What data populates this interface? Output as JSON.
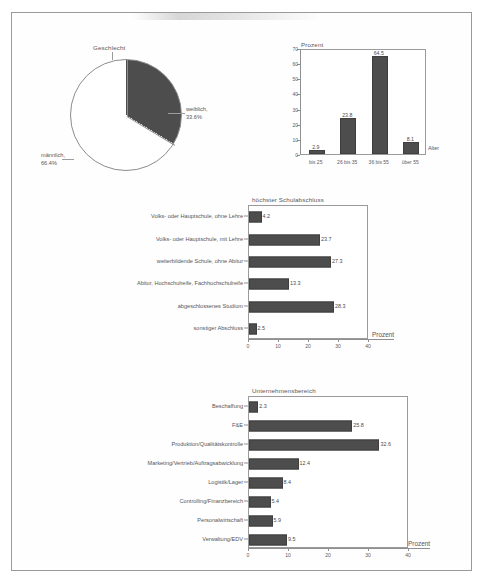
{
  "page": {
    "background_color": "#ffffff",
    "frame_color": "#9a9a9a",
    "bar_color": "#4d4d4d",
    "text_color": "#55565a"
  },
  "charts": {
    "gender": {
      "title": "Geschlecht",
      "labels": {
        "female_name": "weiblich,",
        "female_pct": "33.6%",
        "male_name": "männlich,",
        "male_pct": "66.4%"
      }
    },
    "age": {
      "title": "Prozent",
      "xlabel": "Alter",
      "yticks": [
        "0",
        "10",
        "20",
        "30",
        "40",
        "50",
        "60",
        "70"
      ],
      "categories": [
        "bis 25",
        "26 bis 35",
        "36 bis 55",
        "über 55"
      ],
      "values": [
        "2.9",
        "23.8",
        "64.5",
        "8.1"
      ]
    },
    "education": {
      "title": "höchster Schulabschluss",
      "xlabel": "Prozent",
      "xticks": [
        "0",
        "10",
        "20",
        "30",
        "40"
      ],
      "categories": [
        "Volks- oder Hauptschule, ohne Lehre",
        "Volks- oder Hauptschule, mit Lehre",
        "weiterbildende Schule, ohne Abitur",
        "Abitur, Hochschulreife, Fachhochschulreife",
        "abgeschlossenes Studium",
        "sonstiger Abschluss"
      ],
      "values": [
        "4.2",
        "23.7",
        "27.3",
        "13.3",
        "28.3",
        "2.5"
      ]
    },
    "department": {
      "title": "Unternehmensbereich",
      "xlabel": "Prozent",
      "xticks": [
        "0",
        "10",
        "20",
        "30",
        "40"
      ],
      "categories": [
        "Beschaffung",
        "F&E",
        "Produktion/Qualitätskontrolle",
        "Marketing/Vertrieb/Auftragsabwicklung",
        "Logistik/Lager",
        "Controlling/Finanzbereich",
        "Personalwirtschaft",
        "Verwaltung/EDV"
      ],
      "values": [
        "2.3",
        "25.8",
        "32.6",
        "12.4",
        "8.4",
        "5.4",
        "5.9",
        "9.5"
      ]
    }
  },
  "chart_data": [
    {
      "type": "pie",
      "title": "Geschlecht",
      "categories": [
        "weiblich",
        "männlich"
      ],
      "values": [
        33.6,
        66.4
      ],
      "unit": "%",
      "colors": [
        "#4d4d4d",
        "#ffffff"
      ],
      "legend": "labels-with-leader-lines"
    },
    {
      "type": "bar",
      "orientation": "vertical",
      "title": "Prozent",
      "xlabel": "Alter",
      "ylabel": "Prozent",
      "categories": [
        "bis 25",
        "26 bis 35",
        "36 bis 55",
        "über 55"
      ],
      "values": [
        2.9,
        23.8,
        64.5,
        8.1
      ],
      "ylim": [
        0,
        70
      ],
      "ytick_step": 10,
      "grid": false,
      "data_labels": true
    },
    {
      "type": "bar",
      "orientation": "horizontal",
      "title": "höchster Schulabschluss",
      "xlabel": "Prozent",
      "categories": [
        "Volks- oder Hauptschule, ohne Lehre",
        "Volks- oder Hauptschule, mit Lehre",
        "weiterbildende Schule, ohne Abitur",
        "Abitur, Hochschulreife, Fachhochschulreife",
        "abgeschlossenes Studium",
        "sonstiger Abschluss"
      ],
      "values": [
        4.2,
        23.7,
        27.3,
        13.3,
        28.3,
        2.5
      ],
      "xlim": [
        0,
        40
      ],
      "xtick_step": 10,
      "grid": false,
      "data_labels": true
    },
    {
      "type": "bar",
      "orientation": "horizontal",
      "title": "Unternehmensbereich",
      "xlabel": "Prozent",
      "categories": [
        "Beschaffung",
        "F&E",
        "Produktion/Qualitätskontrolle",
        "Marketing/Vertrieb/Auftragsabwicklung",
        "Logistik/Lager",
        "Controlling/Finanzbereich",
        "Personalwirtschaft",
        "Verwaltung/EDV"
      ],
      "values": [
        2.3,
        25.8,
        32.6,
        12.4,
        8.4,
        5.4,
        5.9,
        9.5
      ],
      "xlim": [
        0,
        40
      ],
      "xtick_step": 10,
      "grid": false,
      "data_labels": true
    }
  ]
}
